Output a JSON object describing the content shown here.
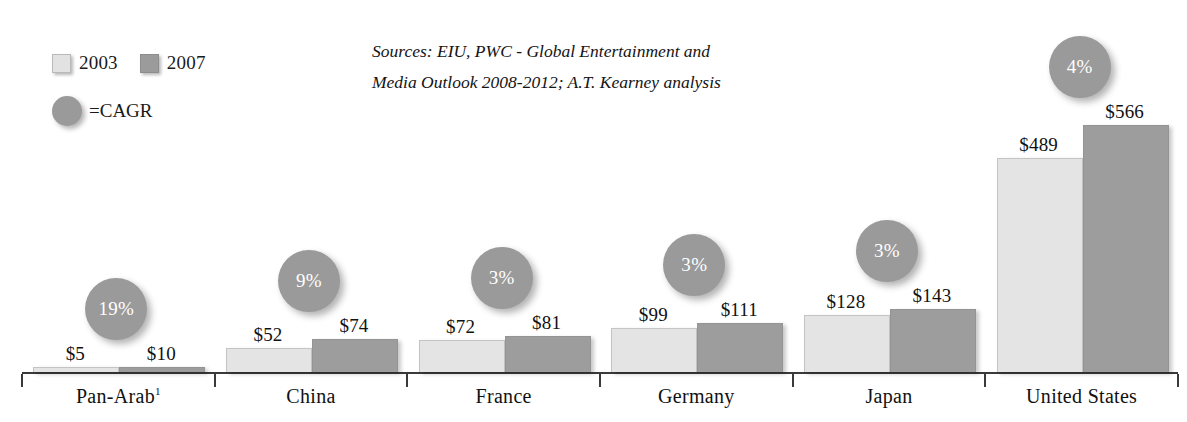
{
  "legend": {
    "series": [
      {
        "name": "2003",
        "swatch": "light-gray-square",
        "color": "#e4e4e4"
      },
      {
        "name": "2007",
        "swatch": "dark-gray-square",
        "color": "#9d9d9d"
      }
    ],
    "cagr_label": "=CAGR",
    "cagr_marker": "gray-circle",
    "cagr_color": "#9a9a9a"
  },
  "source_note": {
    "line1": "Sources: EIU, PWC - Global Entertainment and",
    "line2": "Media Outlook 2008-2012; A.T. Kearney analysis"
  },
  "footnote_marker": "1",
  "chart_data": {
    "type": "bar",
    "title": "",
    "xlabel": "",
    "ylabel": "",
    "ylim": [
      0,
      620
    ],
    "grid": false,
    "legend_position": "top-left",
    "categories": [
      "Pan-Arab",
      "China",
      "France",
      "Germany",
      "Japan",
      "United States"
    ],
    "category_labels": [
      "Pan-Arab¹",
      "China",
      "France",
      "Germany",
      "Japan",
      "United States"
    ],
    "series": [
      {
        "name": "2003",
        "color": "#e4e4e4",
        "values": [
          5,
          52,
          72,
          99,
          128,
          489
        ],
        "value_labels": [
          "$5",
          "$52",
          "$72",
          "$99",
          "$128",
          "$489"
        ]
      },
      {
        "name": "2007",
        "color": "#9d9d9d",
        "values": [
          10,
          74,
          81,
          111,
          143,
          566
        ],
        "value_labels": [
          "$10",
          "$74",
          "$81",
          "$111",
          "$143",
          "$566"
        ]
      }
    ],
    "annotations": {
      "cagr": {
        "label": "CAGR",
        "values": [
          19,
          9,
          3,
          3,
          3,
          4
        ],
        "value_labels": [
          "19%",
          "9%",
          "3%",
          "3%",
          "3%",
          "4%"
        ]
      }
    }
  }
}
